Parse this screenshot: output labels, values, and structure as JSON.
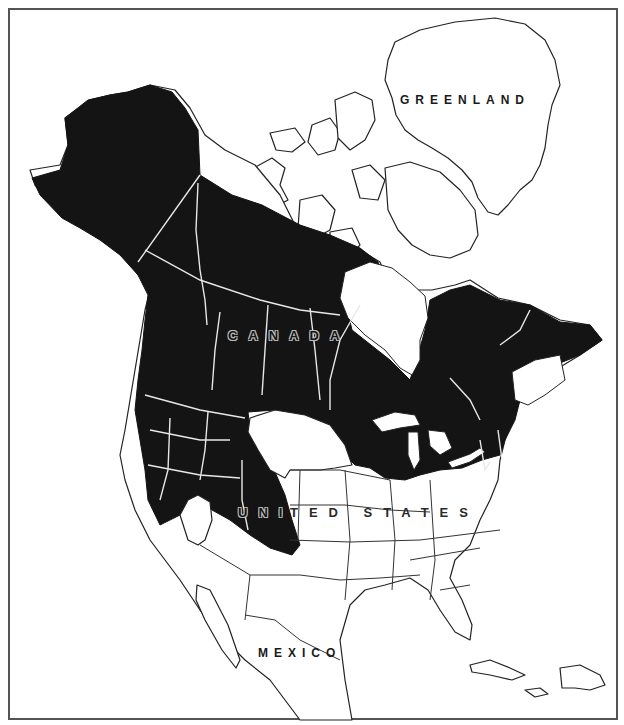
{
  "map": {
    "type": "species-range-map",
    "region": "North America",
    "frame_color": "#555555",
    "range_fill_color": "#141414",
    "land_fill_color": "#ffffff",
    "boundary_color_on_range": "#e8e8e8",
    "labels": {
      "greenland": "GREENLAND",
      "canada": "CANADA",
      "united_states": "UNITED STATES",
      "united_states_part1": "UNI",
      "united_states_part2": "TED  STATES",
      "mexico": "MEXICO"
    }
  }
}
